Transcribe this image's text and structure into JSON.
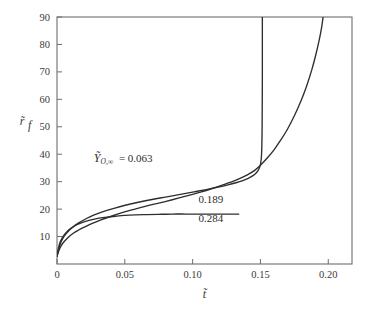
{
  "chart_data": {
    "type": "line",
    "title": "",
    "xlabel": "t̃",
    "ylabel": "r̃_f",
    "xlim": [
      0,
      0.2175
    ],
    "ylim": [
      0,
      90
    ],
    "grid": false,
    "legend_position": "inline-annotations",
    "xticks": [
      0,
      0.05,
      0.1,
      0.15,
      0.2
    ],
    "xtick_labels": [
      "0",
      "0.05",
      "0.10",
      "0.15",
      "0.20"
    ],
    "yticks": [
      10,
      20,
      30,
      40,
      50,
      60,
      70,
      80,
      90
    ],
    "ytick_labels": [
      "10",
      "20",
      "30",
      "40",
      "50",
      "60",
      "70",
      "80",
      "90"
    ],
    "parameter_symbol": "Ỹ",
    "parameter_subscript": "O,∞",
    "series": [
      {
        "name": "0.063",
        "label": "0.063",
        "color": "#2e2e2e",
        "points": [
          [
            0.0,
            2.8
          ],
          [
            0.0015,
            5.0
          ],
          [
            0.003,
            6.6
          ],
          [
            0.005,
            8.0
          ],
          [
            0.008,
            9.6
          ],
          [
            0.012,
            11.2
          ],
          [
            0.016,
            12.4
          ],
          [
            0.02,
            13.4
          ],
          [
            0.026,
            14.8
          ],
          [
            0.032,
            16.0
          ],
          [
            0.04,
            17.4
          ],
          [
            0.048,
            18.7
          ],
          [
            0.056,
            19.8
          ],
          [
            0.065,
            21.0
          ],
          [
            0.075,
            22.2
          ],
          [
            0.085,
            23.4
          ],
          [
            0.095,
            24.7
          ],
          [
            0.105,
            26.1
          ],
          [
            0.115,
            27.6
          ],
          [
            0.125,
            29.3
          ],
          [
            0.132,
            30.6
          ],
          [
            0.14,
            32.4
          ],
          [
            0.146,
            34.2
          ],
          [
            0.15,
            36.0
          ],
          [
            0.155,
            38.6
          ],
          [
            0.16,
            41.6
          ],
          [
            0.165,
            45.2
          ],
          [
            0.17,
            49.2
          ],
          [
            0.175,
            54.0
          ],
          [
            0.18,
            59.6
          ],
          [
            0.184,
            64.8
          ],
          [
            0.188,
            71.0
          ],
          [
            0.191,
            76.6
          ],
          [
            0.1935,
            82.0
          ],
          [
            0.1952,
            86.5
          ],
          [
            0.1962,
            90.0
          ]
        ]
      },
      {
        "name": "0.189",
        "label": "0.189",
        "color": "#2e2e2e",
        "points": [
          [
            0.0,
            2.8
          ],
          [
            0.0012,
            5.4
          ],
          [
            0.0025,
            7.4
          ],
          [
            0.004,
            9.0
          ],
          [
            0.006,
            10.6
          ],
          [
            0.009,
            12.3
          ],
          [
            0.012,
            13.6
          ],
          [
            0.016,
            15.0
          ],
          [
            0.021,
            16.4
          ],
          [
            0.027,
            17.8
          ],
          [
            0.034,
            19.1
          ],
          [
            0.042,
            20.3
          ],
          [
            0.051,
            21.5
          ],
          [
            0.06,
            22.5
          ],
          [
            0.07,
            23.5
          ],
          [
            0.08,
            24.4
          ],
          [
            0.09,
            25.3
          ],
          [
            0.1,
            26.2
          ],
          [
            0.11,
            27.1
          ],
          [
            0.118,
            27.9
          ],
          [
            0.126,
            28.8
          ],
          [
            0.132,
            29.6
          ],
          [
            0.137,
            30.4
          ],
          [
            0.141,
            31.2
          ],
          [
            0.1442,
            32.1
          ],
          [
            0.1465,
            33.0
          ],
          [
            0.1482,
            34.0
          ],
          [
            0.1494,
            35.2
          ],
          [
            0.1502,
            36.8
          ],
          [
            0.1507,
            39.0
          ],
          [
            0.151,
            42.5
          ],
          [
            0.1512,
            48.0
          ],
          [
            0.1513,
            56.0
          ],
          [
            0.1514,
            68.0
          ],
          [
            0.1514,
            80.0
          ],
          [
            0.1514,
            90.0
          ]
        ]
      },
      {
        "name": "0.284",
        "label": "0.284",
        "color": "#2e2e2e",
        "points": [
          [
            0.0,
            2.8
          ],
          [
            0.001,
            5.6
          ],
          [
            0.002,
            7.6
          ],
          [
            0.0035,
            9.2
          ],
          [
            0.005,
            10.4
          ],
          [
            0.007,
            11.6
          ],
          [
            0.01,
            12.9
          ],
          [
            0.013,
            13.9
          ],
          [
            0.017,
            14.8
          ],
          [
            0.021,
            15.5
          ],
          [
            0.026,
            16.2
          ],
          [
            0.031,
            16.7
          ],
          [
            0.037,
            17.1
          ],
          [
            0.043,
            17.4
          ],
          [
            0.05,
            17.7
          ],
          [
            0.058,
            17.9
          ],
          [
            0.066,
            18.0
          ],
          [
            0.075,
            18.1
          ],
          [
            0.085,
            18.2
          ],
          [
            0.095,
            18.2
          ],
          [
            0.105,
            18.2
          ],
          [
            0.115,
            18.2
          ],
          [
            0.125,
            18.2
          ],
          [
            0.134,
            18.2
          ]
        ]
      }
    ],
    "annotations": [
      {
        "text": "0.063",
        "series": "0.063",
        "x": 0.0705,
        "y": 37.0,
        "with_symbol": true
      },
      {
        "text": "0.189",
        "series": "0.189",
        "x": 0.1135,
        "y": 22.2,
        "with_symbol": false
      },
      {
        "text": "0.284",
        "series": "0.284",
        "x": 0.1135,
        "y": 15.3,
        "with_symbol": false
      }
    ]
  },
  "colors": {
    "curve": "#2e2e2e",
    "frame": "#6e6e6e",
    "text": "#3a3a3a",
    "background": "#ffffff"
  }
}
